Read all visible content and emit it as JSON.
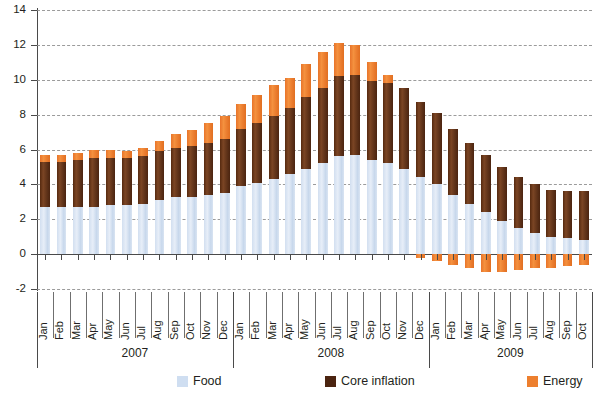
{
  "chart_data": {
    "type": "bar",
    "subtype": "stacked-bar",
    "title": "",
    "xlabel": "",
    "ylabel": "",
    "ylim": [
      -2,
      14
    ],
    "ytick_step": 2,
    "yticks": [
      "14",
      "12",
      "10",
      "8",
      "6",
      "4",
      "2",
      "0",
      "-2"
    ],
    "grid": true,
    "legend_position": "bottom",
    "years": [
      "2007",
      "2008",
      "2009"
    ],
    "year_counts": [
      12,
      12,
      10
    ],
    "categories": [
      "Jan",
      "Feb",
      "Mar",
      "Apr",
      "May",
      "Jun",
      "Jul",
      "Aug",
      "Sep",
      "Oct",
      "Nov",
      "Dec",
      "Jan",
      "Feb",
      "Mar",
      "Apr",
      "May",
      "Jun",
      "Jul",
      "Aug",
      "Sep",
      "Oct",
      "Nov",
      "Dec",
      "Jan",
      "Feb",
      "Mar",
      "Apr",
      "May",
      "Jun",
      "Jul",
      "Aug",
      "Sep",
      "Oct"
    ],
    "series": [
      {
        "name": "Food",
        "color": "#cfdef1",
        "values": [
          2.7,
          2.7,
          2.7,
          2.7,
          2.8,
          2.8,
          2.9,
          3.1,
          3.3,
          3.3,
          3.4,
          3.5,
          3.9,
          4.1,
          4.3,
          4.6,
          4.9,
          5.2,
          5.6,
          5.7,
          5.4,
          5.2,
          4.9,
          4.4,
          4.0,
          3.4,
          2.9,
          2.4,
          1.9,
          1.5,
          1.2,
          1.0,
          0.9,
          0.8
        ]
      },
      {
        "name": "Core inflation",
        "color": "#4b2410",
        "values": [
          2.6,
          2.6,
          2.7,
          2.8,
          2.7,
          2.7,
          2.7,
          2.8,
          2.8,
          2.9,
          3.0,
          3.1,
          3.3,
          3.4,
          3.6,
          3.8,
          4.1,
          4.3,
          4.6,
          4.6,
          4.5,
          4.6,
          4.6,
          4.3,
          4.1,
          3.8,
          3.5,
          3.3,
          3.1,
          2.9,
          2.8,
          2.7,
          2.7,
          2.8
        ]
      },
      {
        "name": "Energy",
        "color": "#ed7f2e",
        "values": [
          0.4,
          0.4,
          0.4,
          0.5,
          0.5,
          0.4,
          0.5,
          0.6,
          0.8,
          0.9,
          1.1,
          1.3,
          1.4,
          1.6,
          1.8,
          1.7,
          1.9,
          2.1,
          1.9,
          1.7,
          1.1,
          0.5,
          0.0,
          -0.2,
          -0.4,
          -0.6,
          -0.8,
          -1.0,
          -1.0,
          -0.9,
          -0.8,
          -0.8,
          -0.7,
          -0.6
        ]
      }
    ]
  },
  "legend": {
    "food": "Food",
    "core": "Core inflation",
    "energy": "Energy"
  }
}
